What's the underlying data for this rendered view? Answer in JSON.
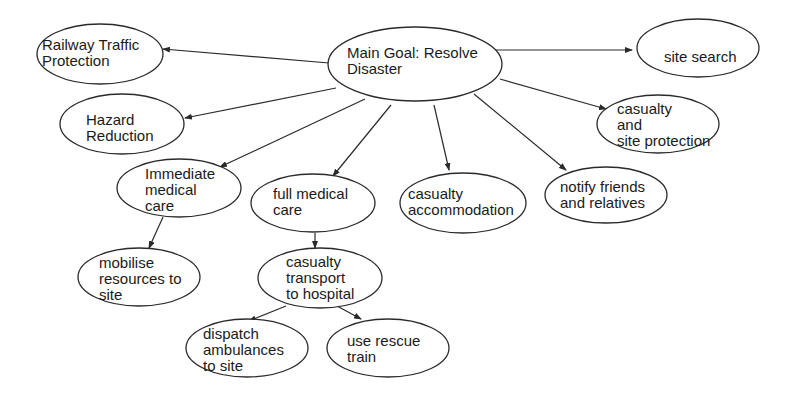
{
  "diagram": {
    "type": "goal-tree",
    "colors": {
      "stroke": "#2a2a2a",
      "text": "#1a1a1a",
      "background": "#ffffff"
    },
    "nodes": [
      {
        "id": "main",
        "lines": [
          "Main Goal: Resolve",
          "Disaster"
        ],
        "cx": 415,
        "cy": 64,
        "rx": 87,
        "ry": 37,
        "tx": 347,
        "ty": 58
      },
      {
        "id": "railway",
        "lines": [
          "Railway Traffic",
          "Protection"
        ],
        "cx": 100,
        "cy": 54,
        "rx": 63,
        "ry": 30,
        "tx": 42,
        "ty": 50
      },
      {
        "id": "site_search",
        "lines": [
          "site search"
        ],
        "cx": 698,
        "cy": 48,
        "rx": 61,
        "ry": 29,
        "tx": 664,
        "ty": 62
      },
      {
        "id": "hazard",
        "lines": [
          "Hazard",
          "Reduction"
        ],
        "cx": 122,
        "cy": 124,
        "rx": 62,
        "ry": 30,
        "tx": 86,
        "ty": 125
      },
      {
        "id": "casualty_site",
        "lines": [
          "casualty",
          "and",
          "site protection"
        ],
        "cx": 658,
        "cy": 124,
        "rx": 61,
        "ry": 29,
        "tx": 617,
        "ty": 114
      },
      {
        "id": "immediate",
        "lines": [
          "Immediate",
          "medical",
          "care"
        ],
        "cx": 179,
        "cy": 188,
        "rx": 62,
        "ry": 29,
        "tx": 145,
        "ty": 179
      },
      {
        "id": "full_medical",
        "lines": [
          "full medical",
          "care"
        ],
        "cx": 313,
        "cy": 203,
        "rx": 62,
        "ry": 29,
        "tx": 273,
        "ty": 199
      },
      {
        "id": "accommodation",
        "lines": [
          "casualty",
          "accommodation"
        ],
        "cx": 463,
        "cy": 203,
        "rx": 63,
        "ry": 30,
        "tx": 408,
        "ty": 199
      },
      {
        "id": "notify",
        "lines": [
          "notify friends",
          "and relatives"
        ],
        "cx": 606,
        "cy": 195,
        "rx": 61,
        "ry": 28,
        "tx": 560,
        "ty": 192
      },
      {
        "id": "mobilise",
        "lines": [
          "mobilise",
          "resources to",
          "site"
        ],
        "cx": 139,
        "cy": 277,
        "rx": 61,
        "ry": 29,
        "tx": 99,
        "ty": 268
      },
      {
        "id": "transport",
        "lines": [
          "casualty",
          "transport",
          "to hospital"
        ],
        "cx": 320,
        "cy": 278,
        "rx": 62,
        "ry": 30,
        "tx": 286,
        "ty": 267
      },
      {
        "id": "dispatch",
        "lines": [
          "dispatch",
          "ambulances",
          "to site"
        ],
        "cx": 247,
        "cy": 348,
        "rx": 61,
        "ry": 29,
        "tx": 203,
        "ty": 339
      },
      {
        "id": "rescue_train",
        "lines": [
          "use rescue",
          "train"
        ],
        "cx": 388,
        "cy": 348,
        "rx": 61,
        "ry": 29,
        "tx": 347,
        "ty": 346
      }
    ],
    "edges": [
      {
        "from": "main",
        "to": "railway",
        "x1": 329,
        "y1": 63,
        "x2": 163,
        "y2": 49
      },
      {
        "from": "main",
        "to": "site_search",
        "x1": 495,
        "y1": 50,
        "x2": 632,
        "y2": 50
      },
      {
        "from": "main",
        "to": "hazard",
        "x1": 336,
        "y1": 88,
        "x2": 185,
        "y2": 118
      },
      {
        "from": "main",
        "to": "casualty_site",
        "x1": 500,
        "y1": 79,
        "x2": 606,
        "y2": 109
      },
      {
        "from": "main",
        "to": "immediate",
        "x1": 365,
        "y1": 99,
        "x2": 220,
        "y2": 167
      },
      {
        "from": "main",
        "to": "full_medical",
        "x1": 391,
        "y1": 105,
        "x2": 333,
        "y2": 176
      },
      {
        "from": "main",
        "to": "accommodation",
        "x1": 434,
        "y1": 105,
        "x2": 449,
        "y2": 170
      },
      {
        "from": "main",
        "to": "notify",
        "x1": 474,
        "y1": 94,
        "x2": 566,
        "y2": 170
      },
      {
        "from": "immediate",
        "to": "mobilise",
        "x1": 163,
        "y1": 217,
        "x2": 149,
        "y2": 248
      },
      {
        "from": "full_medical",
        "to": "transport",
        "x1": 315,
        "y1": 233,
        "x2": 315,
        "y2": 248
      },
      {
        "from": "transport",
        "to": "dispatch",
        "x1": 286,
        "y1": 306,
        "x2": 249,
        "y2": 321
      },
      {
        "from": "transport",
        "to": "rescue_train",
        "x1": 337,
        "y1": 306,
        "x2": 361,
        "y2": 319
      }
    ]
  }
}
